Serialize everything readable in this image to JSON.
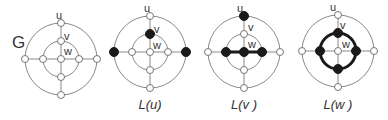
{
  "figure": {
    "graph_label": "G",
    "vertex_labels": {
      "u": "u",
      "v": "v",
      "w": "w"
    },
    "panels": [
      {
        "id": "G",
        "caption": "",
        "cx": 61,
        "cy": 59,
        "highlight": "none"
      },
      {
        "id": "L(u)",
        "caption": "L(u)",
        "cx": 150,
        "cy": 52,
        "highlight": "u"
      },
      {
        "id": "L(v)",
        "caption": "L(v )",
        "cx": 244,
        "cy": 52,
        "highlight": "v"
      },
      {
        "id": "L(w)",
        "caption": "L(w )",
        "cx": 338,
        "cy": 51,
        "highlight": "w"
      }
    ],
    "colors": {
      "edge": "#8a8a8a",
      "highlight": "#1a1a1a",
      "node_fill": "#ffffff"
    }
  }
}
